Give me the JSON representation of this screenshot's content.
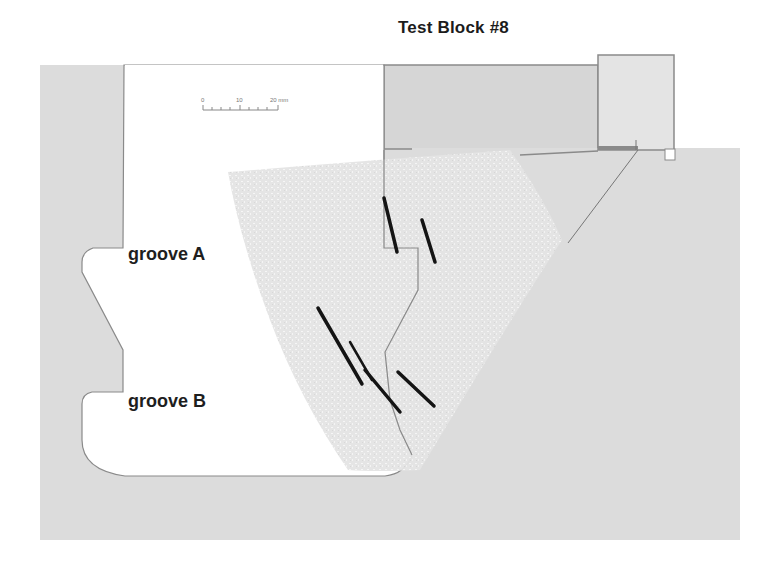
{
  "figure": {
    "title": "Test Block #8",
    "labels": {
      "groove_a": "groove A",
      "groove_b": "groove B"
    },
    "scale_bar": {
      "ticks": [
        "0",
        "10",
        "20 mm"
      ]
    },
    "colors": {
      "background": "#ffffff",
      "material": "#dcdcdc",
      "outline": "#8a8a8a",
      "scan_fan": "#e6e6e6",
      "indications": "#141414",
      "probe": "#e2e2e2"
    },
    "indications": [
      {
        "id": "ind-1",
        "x1": 384,
        "y1": 198,
        "x2": 397,
        "y2": 252
      },
      {
        "id": "ind-2",
        "x1": 422,
        "y1": 220,
        "x2": 435,
        "y2": 262
      },
      {
        "id": "ind-3",
        "x1": 318,
        "y1": 308,
        "x2": 362,
        "y2": 384
      },
      {
        "id": "ind-4",
        "x1": 350,
        "y1": 342,
        "x2": 372,
        "y2": 380
      },
      {
        "id": "ind-5",
        "x1": 365,
        "y1": 370,
        "x2": 400,
        "y2": 412
      },
      {
        "id": "ind-6",
        "x1": 398,
        "y1": 372,
        "x2": 434,
        "y2": 406
      }
    ]
  }
}
